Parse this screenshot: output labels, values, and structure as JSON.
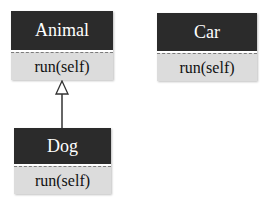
{
  "diagram": {
    "type": "uml-class-diagram",
    "classes": [
      {
        "name": "Animal",
        "methods": [
          "run(self)"
        ]
      },
      {
        "name": "Car",
        "methods": [
          "run(self)"
        ]
      },
      {
        "name": "Dog",
        "methods": [
          "run(self)"
        ]
      }
    ],
    "relations": [
      {
        "from": "Dog",
        "to": "Animal",
        "kind": "inheritance"
      }
    ],
    "colors": {
      "header_bg": "#2b2b2b",
      "header_text": "#ffffff",
      "body_bg": "#dcdcdc",
      "body_text": "#111111",
      "edge": "#333333"
    }
  }
}
